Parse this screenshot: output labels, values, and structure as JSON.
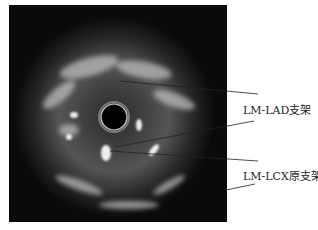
{
  "figure": {
    "labels": [
      {
        "text": "LM-LAD支架"
      },
      {
        "text": "LM-LCX原支架"
      }
    ]
  }
}
